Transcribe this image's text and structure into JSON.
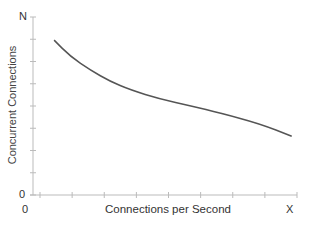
{
  "chart_data": {
    "type": "line",
    "title": "",
    "xlabel": "Connections per Second",
    "ylabel": "Concurrent Connections",
    "x_tick_labels": {
      "min": "0",
      "max": "X"
    },
    "y_tick_labels": {
      "min": "0",
      "max": "N"
    },
    "xlim": [
      0,
      1
    ],
    "ylim": [
      0,
      1
    ],
    "grid": false,
    "legend": null,
    "series": [
      {
        "name": "Concurrent Connections vs Connections per Second",
        "color": "#555555",
        "x": [
          0.08,
          0.14,
          0.22,
          0.29,
          0.37,
          0.48,
          0.6,
          0.71,
          0.86,
          0.98
        ],
        "y": [
          0.87,
          0.78,
          0.7,
          0.64,
          0.59,
          0.54,
          0.5,
          0.46,
          0.4,
          0.33
        ]
      }
    ]
  },
  "labels": {
    "x_axis": "Connections per Second",
    "y_axis": "Concurrent Connections",
    "x_min": "0",
    "x_max": "X",
    "y_min": "0",
    "y_max": "N"
  }
}
